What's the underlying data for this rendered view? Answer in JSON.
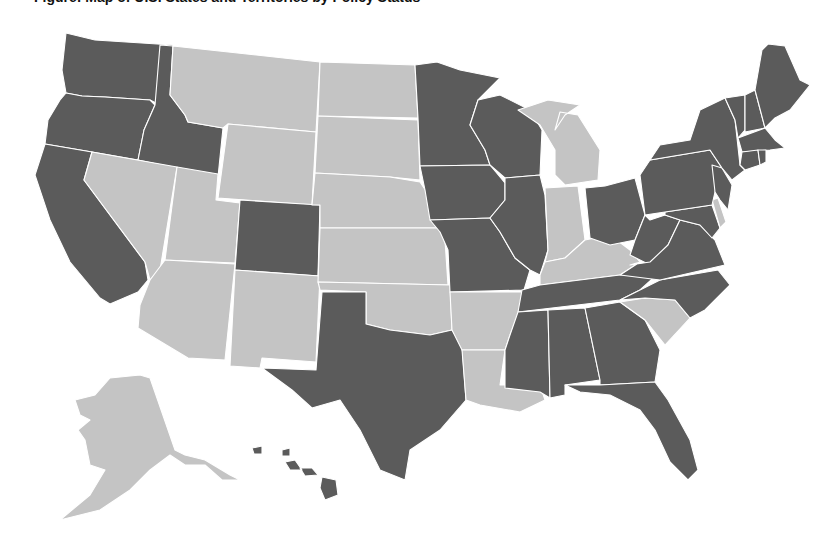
{
  "title": "Figure: Map of U.S. States and Territories by Policy Status",
  "colors": {
    "dark": "#5b5b5b",
    "light": "#c4c4c4",
    "border": "#ffffff",
    "background": "#ffffff"
  },
  "legend": {
    "dark_label": "Dark",
    "light_label": "Light"
  },
  "states": {
    "WA": "dark",
    "OR": "dark",
    "CA": "dark",
    "ID": "dark",
    "NV": "light",
    "UT": "light",
    "AZ": "light",
    "MT": "light",
    "WY": "light",
    "CO": "dark",
    "NM": "light",
    "ND": "light",
    "SD": "light",
    "NE": "light",
    "KS": "light",
    "OK": "light",
    "TX": "dark",
    "MN": "dark",
    "IA": "dark",
    "MO": "dark",
    "AR": "light",
    "LA": "light",
    "WI": "dark",
    "IL": "dark",
    "MI": "light",
    "IN": "light",
    "KY": "light",
    "TN": "dark",
    "MS": "dark",
    "AL": "dark",
    "GA": "dark",
    "FL": "dark",
    "SC": "light",
    "NC": "dark",
    "OH": "dark",
    "WV": "dark",
    "VA": "dark",
    "MD": "dark",
    "DE": "light",
    "PA": "dark",
    "NJ": "dark",
    "NY": "dark",
    "CT": "dark",
    "RI": "dark",
    "MA": "dark",
    "VT": "dark",
    "NH": "dark",
    "ME": "dark",
    "AK": "light",
    "HI": "dark"
  }
}
